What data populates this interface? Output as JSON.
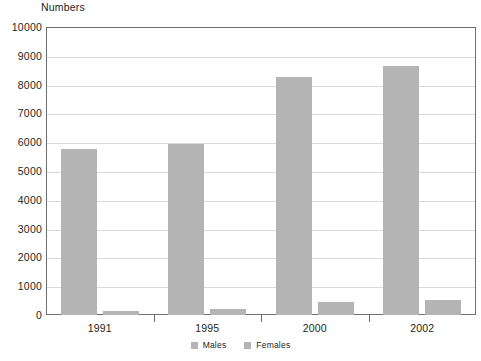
{
  "chart_data": {
    "type": "bar",
    "title": "",
    "ylabel": "Numbers",
    "xlabel": "",
    "categories": [
      "1991",
      "1995",
      "2000",
      "2002"
    ],
    "series": [
      {
        "name": "Males",
        "color": "#b4b4b4",
        "values": [
          5780,
          5930,
          8280,
          8630
        ]
      },
      {
        "name": "Females",
        "color": "#b4b4b4",
        "values": [
          150,
          200,
          450,
          520
        ]
      }
    ],
    "ylim": [
      0,
      10000
    ],
    "ytick_labels": [
      "0",
      "1000",
      "2000",
      "3000",
      "4000",
      "5000",
      "6000",
      "7000",
      "8000",
      "9000",
      "10000"
    ],
    "ytick_values": [
      0,
      1000,
      2000,
      3000,
      4000,
      5000,
      6000,
      7000,
      8000,
      9000,
      10000
    ],
    "grid": true,
    "legend_position": "bottom",
    "legend": [
      "Males",
      "Females"
    ]
  }
}
